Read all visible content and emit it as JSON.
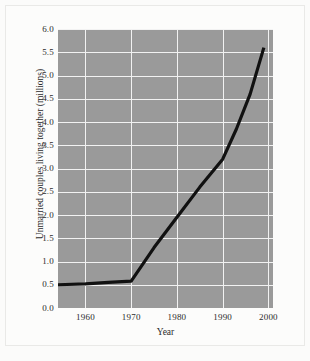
{
  "chart_data": {
    "type": "line",
    "title": "",
    "xlabel": "Year",
    "ylabel": "Unmarried couples living together (millions)",
    "xlim": [
      1954,
      2001
    ],
    "ylim": [
      0.0,
      6.0
    ],
    "grid": true,
    "legend": "none",
    "plot_background": "#9a9a9a",
    "grid_color": "#f2f2f2",
    "line_color": "#111111",
    "xticks": [
      "1960",
      "1970",
      "1980",
      "1990",
      "2000"
    ],
    "xtick_values": [
      1960,
      1970,
      1980,
      1990,
      2000
    ],
    "yticks": [
      "0.0",
      "0.5",
      "1.0",
      "1.5",
      "2.0",
      "2.5",
      "3.0",
      "3.5",
      "4.0",
      "4.5",
      "5.0",
      "5.5",
      "6.0"
    ],
    "ytick_values": [
      0.0,
      0.5,
      1.0,
      1.5,
      2.0,
      2.5,
      3.0,
      3.5,
      4.0,
      4.5,
      5.0,
      5.5,
      6.0
    ],
    "series": [
      {
        "name": "Unmarried couples living together",
        "x": [
          1954,
          1960,
          1965,
          1970,
          1975,
          1980,
          1985,
          1990,
          1993,
          1996,
          1999
        ],
        "values": [
          0.5,
          0.52,
          0.55,
          0.58,
          1.3,
          1.95,
          2.6,
          3.2,
          3.85,
          4.6,
          5.6
        ]
      }
    ]
  }
}
